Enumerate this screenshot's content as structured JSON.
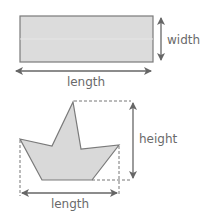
{
  "figure1": {
    "shape": "rectangle",
    "length_label": "length",
    "width_label": "width"
  },
  "figure2": {
    "shape": "irregular polygon (boat)",
    "length_label": "length",
    "height_label": "height"
  },
  "colors": {
    "fill": "#d9d9d9",
    "stroke": "#7a7a7a",
    "arrow": "#666666",
    "text": "#6a6a6a"
  }
}
